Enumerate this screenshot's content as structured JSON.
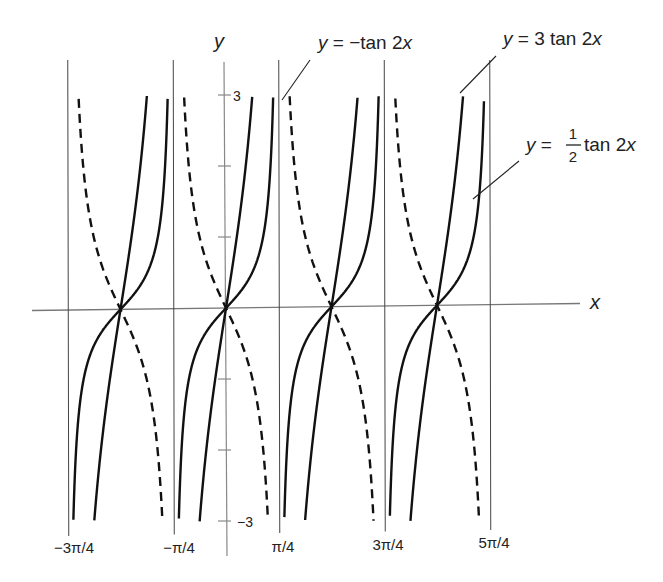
{
  "chart_data": {
    "type": "line",
    "title": "",
    "xlabel": "x",
    "ylabel": "y",
    "ylim": [
      -3,
      3
    ],
    "xlim_radians": [
      -0.75,
      1.25
    ],
    "x_ticks": [
      "-3π/4",
      "-π/4",
      "π/4",
      "3π/4",
      "5π/4"
    ],
    "y_ticks": [
      {
        "value": 3,
        "label": "3"
      },
      {
        "value": 2,
        "label": ""
      },
      {
        "value": 1,
        "label": ""
      },
      {
        "value": -1,
        "label": ""
      },
      {
        "value": -2,
        "label": ""
      },
      {
        "value": -3,
        "label": "−3"
      }
    ],
    "asymptotes": [
      "-3π/4",
      "-π/4",
      "π/4",
      "3π/4",
      "5π/4"
    ],
    "zeros": [
      "-π/2",
      "0",
      "π/2",
      "π"
    ],
    "grid": false,
    "series": [
      {
        "name": "y = 3 tan 2x",
        "style": "solid",
        "amplitude": 3
      },
      {
        "name": "y = 1/2 tan 2x",
        "style": "solid",
        "amplitude": 0.5
      },
      {
        "name": "y = −tan 2x",
        "style": "dashed",
        "amplitude": -1
      }
    ],
    "annotations": [
      {
        "text": "y = −tan 2x",
        "points_to": "dashed curve near π/4 asymptote, top"
      },
      {
        "text": "y = 3 tan 2x",
        "points_to": "steep solid curve near 3π/4, top"
      },
      {
        "text": "y = 1/2 tan 2x",
        "points_to": "gentle solid curve near 3π/4"
      }
    ]
  },
  "labels": {
    "x_axis": "x",
    "y_axis": "y",
    "y_top": "3",
    "y_bottom": "−3",
    "ticks": [
      "−3π/4",
      "−π/4",
      "π/4",
      "3π/4",
      "5π/4"
    ],
    "ann_neg": {
      "y": "y",
      "eq": " = −tan 2",
      "x": "x"
    },
    "ann_three": {
      "y": "y",
      "eq": " = 3 tan 2",
      "x": "x"
    },
    "ann_half": {
      "y": "y",
      "eq": " = ",
      "num": "1",
      "den": "2",
      "rest": " tan 2",
      "x": "x"
    }
  }
}
